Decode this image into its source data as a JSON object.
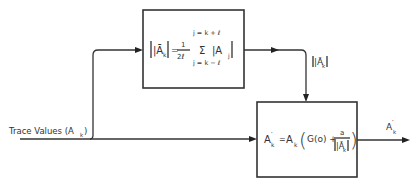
{
  "diagram": {
    "input_label": "Trace Values (A",
    "input_label_sub": "k",
    "input_label_close": ")",
    "averaging_block": {
      "lhs": "|Ā",
      "lhs_sub": "k",
      "lhs_close": "|",
      "equals": "=",
      "frac_num": "1",
      "frac_den": "2ℓ",
      "sum_upper": "j = k + ℓ",
      "sum_symbol": "Σ",
      "sum_lower": "j = k − ℓ",
      "term": "|A",
      "term_sub": "j",
      "term_close": "|"
    },
    "intermediate_label": "|Ā",
    "intermediate_label_sub": "k",
    "intermediate_label_close": "|",
    "gain_block": {
      "lhs": "A",
      "lhs_sup": "′",
      "lhs_sub": "k",
      "equals": "=",
      "rhs_a": "A",
      "rhs_a_sub": "k",
      "open_paren": "(",
      "g_term": "G(o) +",
      "frac_num": "a",
      "frac_den": "|Ā",
      "frac_den_sub": "k",
      "frac_den_close": "|",
      "close_paren": ")"
    },
    "output_label": "A",
    "output_label_sup": "′",
    "output_label_sub": "k"
  }
}
